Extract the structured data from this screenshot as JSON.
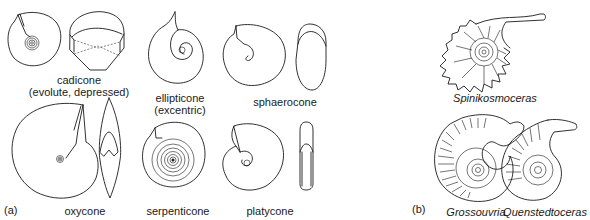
{
  "figure": {
    "panels": [
      {
        "id": "a",
        "label": "(a)",
        "items": [
          {
            "name": "cadicone",
            "line1": "cadicone",
            "line2": "(evolute, depressed)"
          },
          {
            "name": "ellipticone",
            "line1": "ellipticone",
            "line2": "(excentric)"
          },
          {
            "name": "sphaerocone",
            "line1": "sphaerocone"
          },
          {
            "name": "oxycone",
            "line1": "oxycone"
          },
          {
            "name": "serpenticone",
            "line1": "serpenticone"
          },
          {
            "name": "platycone",
            "line1": "platycone"
          }
        ]
      },
      {
        "id": "b",
        "label": "(b)",
        "items": [
          {
            "name": "spinikosmoceras",
            "line1": "Spinikosmoceras"
          },
          {
            "name": "grossouvria",
            "line1": "Grossouvria"
          },
          {
            "name": "quenstedtoceras",
            "line1": "Quenstedtoceras"
          }
        ]
      }
    ]
  }
}
